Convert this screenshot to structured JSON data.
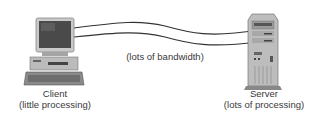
{
  "diagram": {
    "client": {
      "title": "Client",
      "subtitle": "(little processing)"
    },
    "server": {
      "title": "Server",
      "subtitle": "(lots of processing)"
    },
    "connection": {
      "label": "(lots of bandwidth)",
      "line_count": 2
    },
    "colors": {
      "line": "#333333",
      "device_light": "#c8c8c8",
      "device_mid": "#9a9a9a",
      "device_dark": "#555555",
      "screen": "#4a4a4a"
    }
  }
}
